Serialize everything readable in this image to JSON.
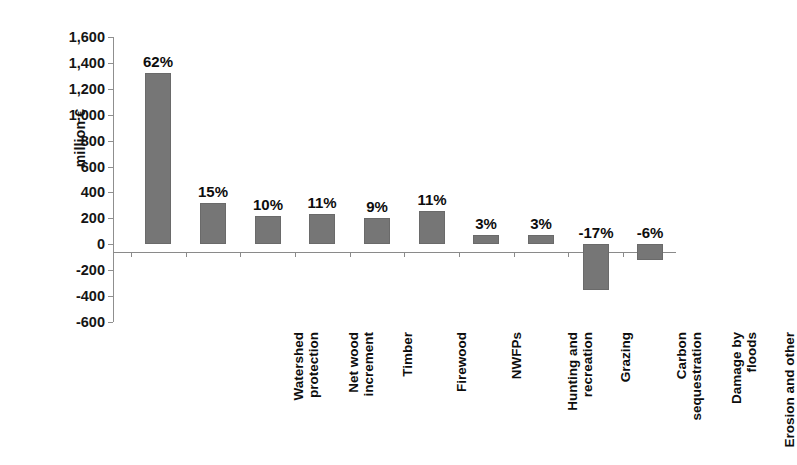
{
  "chart_data": {
    "type": "bar",
    "title": "",
    "subtitle": "",
    "xlabel": "",
    "ylabel": "million €",
    "ylim": [
      -600,
      1600
    ],
    "ytick_step": 200,
    "grid": false,
    "legend": "none",
    "bar_color": "#767676",
    "zero_line": 0,
    "categories": [
      "Watershed protection",
      "Net wood increment",
      "Timber",
      "Firewood",
      "NWFPs",
      "Hunting and recreation",
      "Grazing",
      "Carbon sequestration",
      "Damage by floods",
      "Erosion and other"
    ],
    "category_lines": [
      [
        "Watershed",
        "protection"
      ],
      [
        "Net wood",
        "increment"
      ],
      [
        "Timber"
      ],
      [
        "Firewood"
      ],
      [
        "NWFPs"
      ],
      [
        "Hunting and",
        "recreation"
      ],
      [
        "Grazing"
      ],
      [
        "Carbon",
        "sequestration"
      ],
      [
        "Damage by",
        "floods"
      ],
      [
        "Erosion and other"
      ]
    ],
    "values": [
      1320,
      320,
      215,
      230,
      205,
      255,
      70,
      70,
      -350,
      -120
    ],
    "data_labels": [
      "62%",
      "15%",
      "10%",
      "11%",
      "9%",
      "11%",
      "-17%",
      "-6%"
    ],
    "point_labels": [
      "62%",
      "15%",
      "10%",
      "11%",
      "9%",
      "11%",
      "3%",
      "3%",
      "-17%",
      "-6%"
    ],
    "ytick_labels": [
      "1,600",
      "1,400",
      "1,200",
      "1,000",
      "800",
      "600",
      "400",
      "200",
      "0",
      "-200",
      "-400",
      "-600"
    ],
    "ytick_values": [
      1600,
      1400,
      1200,
      1000,
      800,
      600,
      400,
      200,
      0,
      -200,
      -400,
      -600
    ]
  }
}
